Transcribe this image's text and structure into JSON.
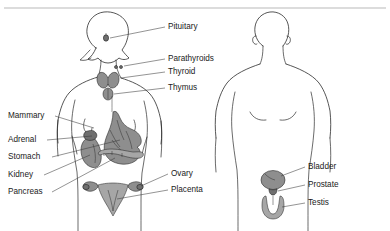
{
  "figure": {
    "background_color": "#ffffff",
    "line_color": "#2b2b2b",
    "organ_color": "#8e8e8e",
    "text_color": "#1a1a1a"
  },
  "figures": {
    "female": {
      "name": "Female body outline",
      "side": "left"
    },
    "male": {
      "name": "Male body outline",
      "side": "right"
    }
  },
  "labels": {
    "pituitary": "Pituitary",
    "parathyroids": "Parathyroids",
    "thyroid": "Thyroid",
    "thymus": "Thymus",
    "mammary": "Mammary",
    "adrenal": "Adrenal",
    "stomach": "Stomach",
    "kidney": "Kidney",
    "pancreas": "Pancreas",
    "ovary": "Ovary",
    "placenta": "Placenta",
    "bladder": "Bladder",
    "prostate": "Prostate",
    "testis": "Testis"
  },
  "label_list": [
    {
      "id": "pituitary",
      "text": "Pituitary",
      "side": "right",
      "x": 168,
      "y": 27
    },
    {
      "id": "parathyroids",
      "text": "Parathyroids",
      "side": "right",
      "x": 168,
      "y": 59
    },
    {
      "id": "thyroid",
      "text": "Thyroid",
      "side": "right",
      "x": 168,
      "y": 72
    },
    {
      "id": "thymus",
      "text": "Thymus",
      "side": "right",
      "x": 168,
      "y": 88
    },
    {
      "id": "mammary",
      "text": "Mammary",
      "side": "left",
      "x": 8,
      "y": 116
    },
    {
      "id": "adrenal",
      "text": "Adrenal",
      "side": "left",
      "x": 8,
      "y": 140
    },
    {
      "id": "stomach",
      "text": "Stomach",
      "side": "left",
      "x": 8,
      "y": 157
    },
    {
      "id": "kidney",
      "text": "Kidney",
      "side": "left",
      "x": 8,
      "y": 175
    },
    {
      "id": "pancreas",
      "text": "Pancreas",
      "side": "left",
      "x": 8,
      "y": 192
    },
    {
      "id": "ovary",
      "text": "Ovary",
      "side": "right",
      "x": 171,
      "y": 174
    },
    {
      "id": "placenta",
      "text": "Placenta",
      "side": "right",
      "x": 171,
      "y": 190
    },
    {
      "id": "bladder",
      "text": "Bladder",
      "side": "right",
      "x": 308,
      "y": 167
    },
    {
      "id": "prostate",
      "text": "Prostate",
      "side": "right",
      "x": 308,
      "y": 185
    },
    {
      "id": "testis",
      "text": "Testis",
      "side": "right",
      "x": 308,
      "y": 203
    }
  ]
}
